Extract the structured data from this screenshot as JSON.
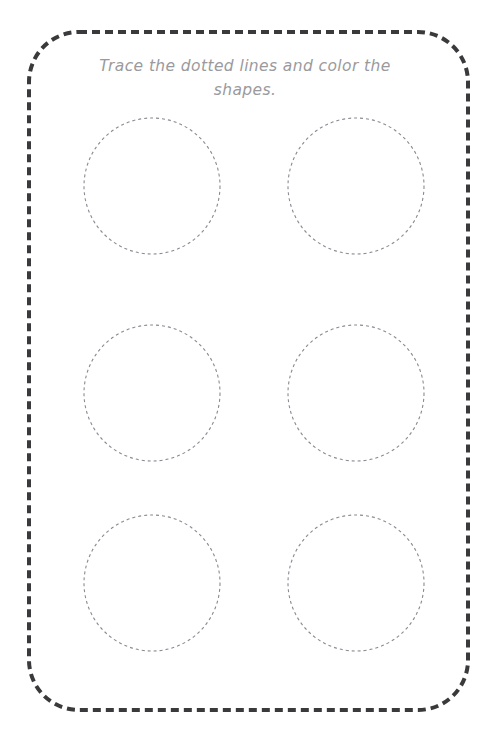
{
  "worksheet": {
    "page_width": 489,
    "page_height": 729,
    "background_color": "#ffffff",
    "title_lines": {
      "line1": "Trace the dotted lines and color the",
      "line2": "shapes."
    },
    "instruction_full_text": "Trace the dotted lines and color the shapes.",
    "instruction_color": "#9a9a9e",
    "border": {
      "name": "dashed-rounded-rectangle-frame",
      "color": "#3a3a3c",
      "stroke_width": 4,
      "dash": "8 5",
      "corner_radius": 50,
      "x": 29,
      "y": 32,
      "width": 439,
      "height": 678
    },
    "shape_grid": {
      "shape_type": "circle",
      "rows": 3,
      "columns": 2,
      "total_shapes": 6,
      "stroke_color": "#8a8a92",
      "stroke_width": 1.1,
      "dash": "3 3",
      "fill": "none",
      "radius": 68,
      "column_centers_x": [
        152,
        356
      ],
      "row_centers_y": [
        186,
        393,
        583
      ],
      "shapes": [
        {
          "id": "circle-r1c1",
          "cx": 152,
          "cy": 186,
          "r": 68,
          "row": 1,
          "column": 1
        },
        {
          "id": "circle-r1c2",
          "cx": 356,
          "cy": 186,
          "r": 68,
          "row": 1,
          "column": 2
        },
        {
          "id": "circle-r2c1",
          "cx": 152,
          "cy": 393,
          "r": 68,
          "row": 2,
          "column": 1
        },
        {
          "id": "circle-r2c2",
          "cx": 356,
          "cy": 393,
          "r": 68,
          "row": 2,
          "column": 2
        },
        {
          "id": "circle-r3c1",
          "cx": 152,
          "cy": 583,
          "r": 68,
          "row": 3,
          "column": 1
        },
        {
          "id": "circle-r3c2",
          "cx": 356,
          "cy": 583,
          "r": 68,
          "row": 3,
          "column": 2
        }
      ]
    }
  }
}
